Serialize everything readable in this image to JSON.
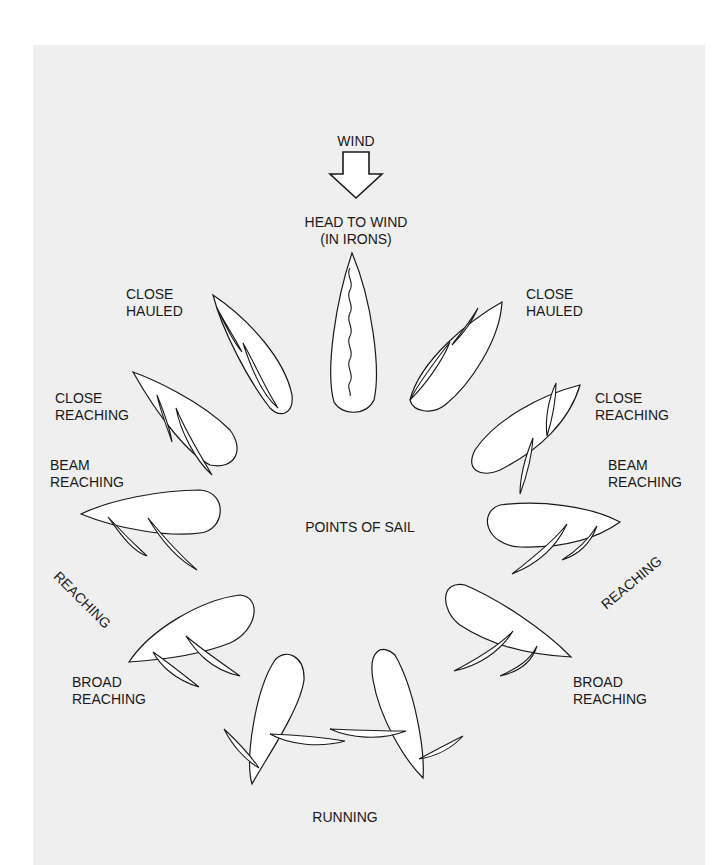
{
  "title": "POINTS OF SAIL",
  "wind": {
    "label": "WIND",
    "icon": "down-arrow-icon"
  },
  "labels": {
    "head_to_wind": "HEAD TO WIND\n(IN IRONS)",
    "close_hauled_left": "CLOSE\nHAULED",
    "close_hauled_right": "CLOSE\nHAULED",
    "close_reaching_left": "CLOSE\nREACHING",
    "close_reaching_right": "CLOSE\nREACHING",
    "beam_reaching_left": "BEAM\nREACHING",
    "beam_reaching_right": "BEAM\nREACHING",
    "reaching_left": "REACHING",
    "reaching_right": "REACHING",
    "broad_reaching_left": "BROAD\nREACHING",
    "broad_reaching_right": "BROAD\nREACHING",
    "running": "RUNNING"
  },
  "colors": {
    "paper": "#efefef",
    "line": "#1a1a1a",
    "fill": "#ffffff"
  }
}
